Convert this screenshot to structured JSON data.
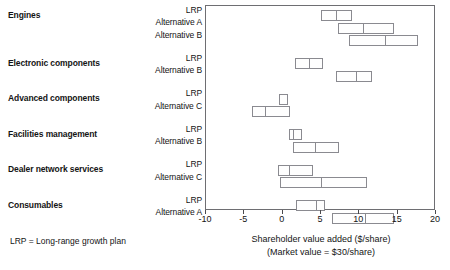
{
  "chart_data": {
    "type": "bar",
    "subtype": "range-box-plot",
    "title": "",
    "xlabel": "Shareholder value added ($/share)",
    "xlabel_sub": "(Market value = $30/share)",
    "ylabel": "",
    "xlim": [
      -10,
      20
    ],
    "xticks": [
      -10,
      -5,
      0,
      5,
      10,
      15,
      20
    ],
    "xticklabels": [
      "-10",
      "-5",
      "0",
      "5",
      "10",
      "15",
      "20"
    ],
    "grid": false,
    "legend": false,
    "footnote": "LRP = Long-range growth plan",
    "groups": [
      {
        "name": "Engines",
        "rows": [
          {
            "label": "LRP",
            "low": 5.0,
            "mid": 7.0,
            "high": 9.0
          },
          {
            "label": "Alternative A",
            "low": 7.2,
            "mid": 10.5,
            "high": 14.5
          },
          {
            "label": "Alternative B",
            "low": 8.6,
            "mid": 13.3,
            "high": 17.6
          }
        ]
      },
      {
        "name": "Electronic components",
        "rows": [
          {
            "label": "LRP",
            "low": 1.6,
            "mid": 3.4,
            "high": 5.2
          },
          {
            "label": "Alternative B",
            "low": 7.0,
            "mid": 9.5,
            "high": 11.6
          }
        ]
      },
      {
        "name": "Advanced components",
        "rows": [
          {
            "label": "LRP",
            "low": -0.5,
            "mid": -0.5,
            "high": 0.7
          },
          {
            "label": "Alternative C",
            "low": -4.0,
            "mid": -2.3,
            "high": 1.0
          }
        ]
      },
      {
        "name": "Facilities management",
        "rows": [
          {
            "label": "LRP",
            "low": 0.8,
            "mid": 1.3,
            "high": 2.5
          },
          {
            "label": "Alternative B",
            "low": 1.3,
            "mid": 4.2,
            "high": 7.3
          }
        ]
      },
      {
        "name": "Dealer network services",
        "rows": [
          {
            "label": "LRP",
            "low": -0.6,
            "mid": 0.8,
            "high": 4.0
          },
          {
            "label": "Alternative C",
            "low": -0.3,
            "mid": 5.0,
            "high": 11.0
          }
        ]
      },
      {
        "name": "Consumables",
        "rows": [
          {
            "label": "LRP",
            "low": 1.8,
            "mid": 4.3,
            "high": 5.5
          },
          {
            "label": "Alternative A",
            "low": 6.4,
            "mid": 10.7,
            "high": 14.5
          }
        ]
      }
    ]
  }
}
